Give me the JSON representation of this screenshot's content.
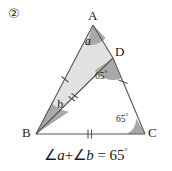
{
  "figure": {
    "item_number": "②",
    "type": "geometry-diagram",
    "colors": {
      "stroke": "#555555",
      "shaded_region": "#e2e2e2",
      "angle_wedge": "#a9a9a9",
      "text": "#1a1a1a",
      "background": "#ffffff"
    },
    "vertices": [
      {
        "name": "A",
        "label": "A",
        "x": 93,
        "y": 25
      },
      {
        "name": "B",
        "label": "B",
        "x": 36,
        "y": 134
      },
      {
        "name": "C",
        "label": "C",
        "x": 145,
        "y": 134
      },
      {
        "name": "D",
        "label": "D",
        "x": 113,
        "y": 58
      }
    ],
    "segments": [
      {
        "name": "AB",
        "from": "A",
        "to": "B",
        "ticks": 1
      },
      {
        "name": "BC",
        "from": "B",
        "to": "C",
        "ticks": 2
      },
      {
        "name": "BD",
        "from": "B",
        "to": "D",
        "ticks": 2
      },
      {
        "name": "DC",
        "from": "D",
        "to": "C",
        "ticks": 1
      },
      {
        "name": "AD",
        "from": "A",
        "to": "D",
        "ticks": 0
      }
    ],
    "angles": [
      {
        "name": "angle-a",
        "at": "A",
        "label": "a",
        "label_style": "italic",
        "value": null,
        "shaded": true
      },
      {
        "name": "angle-b",
        "at": "B",
        "label": "b",
        "label_style": "italic",
        "value": null,
        "shaded": true
      },
      {
        "name": "angle-d",
        "at": "D",
        "label": "65",
        "unit": "°",
        "value": "65°",
        "shaded": true
      },
      {
        "name": "angle-c",
        "at": "C",
        "label": "65",
        "unit": "°",
        "value": "65°",
        "shaded": true
      }
    ],
    "equation": {
      "lhs_angle_symbol_1": "∠",
      "lhs_var_1": "a",
      "plus": "+",
      "lhs_angle_symbol_2": "∠",
      "lhs_var_2": "b",
      "equals": "=",
      "rhs_value": "65",
      "rhs_unit": "°",
      "full_text": "∠a+∠b = 65°"
    }
  }
}
